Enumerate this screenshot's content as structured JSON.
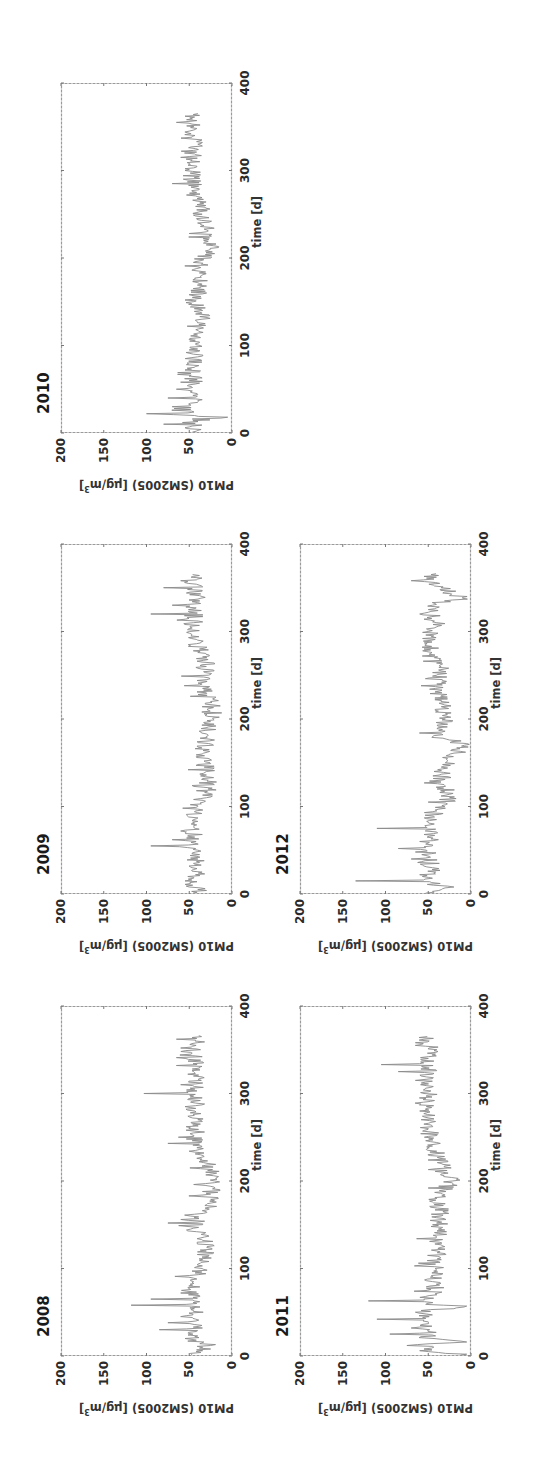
{
  "figure": {
    "ylabel_text": "PM10 (SM2005) [μg/m",
    "ylabel_sup": "3",
    "ylabel_close": "]",
    "xlabel": "time [d]",
    "x_ticks": [
      "0",
      "100",
      "200",
      "300",
      "400"
    ],
    "y_ticks": [
      "0",
      "50",
      "100",
      "150",
      "200"
    ],
    "line_color": "#8a8a8a",
    "axis_color": "#9a9a9a"
  },
  "chart_data": [
    {
      "type": "line",
      "title": "2008",
      "xlabel": "time [d]",
      "ylabel": "PM10 (SM2005) [μg/m³]",
      "xlim": [
        0,
        400
      ],
      "ylim": [
        0,
        200
      ],
      "x_ticks": [
        0,
        100,
        200,
        300,
        400
      ],
      "y_ticks": [
        0,
        50,
        100,
        150,
        200
      ],
      "grid": false,
      "n_days": 366,
      "baseline": 28,
      "key_points": [
        [
          5,
          42
        ],
        [
          12,
          25
        ],
        [
          20,
          55
        ],
        [
          30,
          85
        ],
        [
          38,
          75
        ],
        [
          45,
          60
        ],
        [
          52,
          45
        ],
        [
          58,
          118
        ],
        [
          65,
          95
        ],
        [
          72,
          60
        ],
        [
          85,
          45
        ],
        [
          100,
          35
        ],
        [
          120,
          30
        ],
        [
          140,
          32
        ],
        [
          152,
          75
        ],
        [
          165,
          30
        ],
        [
          185,
          25
        ],
        [
          200,
          20
        ],
        [
          220,
          28
        ],
        [
          243,
          75
        ],
        [
          255,
          45
        ],
        [
          270,
          40
        ],
        [
          285,
          55
        ],
        [
          300,
          103
        ],
        [
          310,
          60
        ],
        [
          320,
          45
        ],
        [
          332,
          65
        ],
        [
          345,
          48
        ],
        [
          355,
          42
        ],
        [
          362,
          65
        ]
      ]
    },
    {
      "type": "line",
      "title": "2009",
      "xlabel": "time [d]",
      "ylabel": "PM10 (SM2005) [μg/m³]",
      "xlim": [
        0,
        400
      ],
      "ylim": [
        0,
        200
      ],
      "x_ticks": [
        0,
        100,
        200,
        300,
        400
      ],
      "y_ticks": [
        0,
        50,
        100,
        150,
        200
      ],
      "grid": false,
      "n_days": 365,
      "baseline": 30,
      "key_points": [
        [
          5,
          40
        ],
        [
          15,
          55
        ],
        [
          25,
          35
        ],
        [
          35,
          45
        ],
        [
          45,
          38
        ],
        [
          55,
          95
        ],
        [
          62,
          70
        ],
        [
          72,
          60
        ],
        [
          85,
          45
        ],
        [
          100,
          40
        ],
        [
          120,
          28
        ],
        [
          140,
          30
        ],
        [
          160,
          35
        ],
        [
          180,
          30
        ],
        [
          200,
          22
        ],
        [
          220,
          25
        ],
        [
          240,
          35
        ],
        [
          260,
          30
        ],
        [
          280,
          38
        ],
        [
          300,
          50
        ],
        [
          310,
          45
        ],
        [
          320,
          95
        ],
        [
          330,
          70
        ],
        [
          340,
          35
        ],
        [
          350,
          80
        ],
        [
          358,
          60
        ],
        [
          363,
          45
        ]
      ]
    },
    {
      "type": "line",
      "title": "2010",
      "xlabel": "time [d]",
      "ylabel": "PM10 (SM2005) [μg/m³]",
      "xlim": [
        0,
        400
      ],
      "ylim": [
        0,
        200
      ],
      "x_ticks": [
        0,
        100,
        200,
        300,
        400
      ],
      "y_ticks": [
        0,
        50,
        100,
        150,
        200
      ],
      "grid": false,
      "n_days": 365,
      "baseline": 30,
      "key_points": [
        [
          3,
          40
        ],
        [
          10,
          80
        ],
        [
          18,
          5
        ],
        [
          22,
          100
        ],
        [
          30,
          70
        ],
        [
          40,
          75
        ],
        [
          50,
          65
        ],
        [
          60,
          50
        ],
        [
          72,
          55
        ],
        [
          90,
          45
        ],
        [
          110,
          40
        ],
        [
          130,
          35
        ],
        [
          150,
          45
        ],
        [
          170,
          35
        ],
        [
          190,
          40
        ],
        [
          210,
          25
        ],
        [
          230,
          30
        ],
        [
          250,
          35
        ],
        [
          270,
          40
        ],
        [
          285,
          70
        ],
        [
          300,
          55
        ],
        [
          315,
          60
        ],
        [
          330,
          40
        ],
        [
          345,
          50
        ],
        [
          355,
          65
        ],
        [
          362,
          55
        ]
      ]
    },
    {
      "type": "line",
      "title": "2011",
      "xlabel": "time [d]",
      "ylabel": "PM10 (SM2005) [μg/m³]",
      "xlim": [
        0,
        400
      ],
      "ylim": [
        0,
        200
      ],
      "x_ticks": [
        0,
        100,
        200,
        300,
        400
      ],
      "y_ticks": [
        0,
        50,
        100,
        150,
        200
      ],
      "grid": false,
      "n_days": 365,
      "baseline": 35,
      "key_points": [
        [
          2,
          5
        ],
        [
          6,
          60
        ],
        [
          12,
          75
        ],
        [
          16,
          5
        ],
        [
          25,
          95
        ],
        [
          32,
          70
        ],
        [
          42,
          110
        ],
        [
          50,
          65
        ],
        [
          57,
          5
        ],
        [
          63,
          120
        ],
        [
          70,
          40
        ],
        [
          85,
          45
        ],
        [
          100,
          42
        ],
        [
          120,
          40
        ],
        [
          140,
          38
        ],
        [
          160,
          35
        ],
        [
          180,
          40
        ],
        [
          200,
          22
        ],
        [
          220,
          35
        ],
        [
          240,
          45
        ],
        [
          260,
          50
        ],
        [
          280,
          60
        ],
        [
          300,
          55
        ],
        [
          315,
          65
        ],
        [
          325,
          85
        ],
        [
          333,
          105
        ],
        [
          342,
          50
        ],
        [
          350,
          40
        ],
        [
          358,
          65
        ],
        [
          362,
          55
        ]
      ]
    },
    {
      "type": "line",
      "title": "2012",
      "xlabel": "time [d]",
      "ylabel": "PM10 (SM2005) [μg/m³]",
      "xlim": [
        0,
        400
      ],
      "ylim": [
        0,
        200
      ],
      "x_ticks": [
        0,
        100,
        200,
        300,
        400
      ],
      "y_ticks": [
        0,
        50,
        100,
        150,
        200
      ],
      "grid": false,
      "n_days": 366,
      "baseline": 32,
      "key_points": [
        [
          3,
          45
        ],
        [
          8,
          20
        ],
        [
          15,
          135
        ],
        [
          22,
          60
        ],
        [
          30,
          45
        ],
        [
          40,
          70
        ],
        [
          48,
          65
        ],
        [
          52,
          85
        ],
        [
          60,
          60
        ],
        [
          68,
          55
        ],
        [
          75,
          110
        ],
        [
          82,
          50
        ],
        [
          95,
          40
        ],
        [
          110,
          25
        ],
        [
          130,
          35
        ],
        [
          150,
          30
        ],
        [
          172,
          5
        ],
        [
          180,
          45
        ],
        [
          200,
          30
        ],
        [
          220,
          35
        ],
        [
          240,
          40
        ],
        [
          260,
          35
        ],
        [
          280,
          55
        ],
        [
          300,
          50
        ],
        [
          310,
          40
        ],
        [
          320,
          60
        ],
        [
          330,
          45
        ],
        [
          338,
          10
        ],
        [
          350,
          35
        ],
        [
          358,
          70
        ],
        [
          363,
          55
        ]
      ]
    }
  ],
  "layout": {
    "panels": [
      {
        "left": 115,
        "top": 61
      },
      {
        "left": 577,
        "top": 61
      },
      {
        "left": 1038,
        "top": 61
      },
      {
        "left": 115,
        "top": 300
      },
      {
        "left": 577,
        "top": 300
      }
    ],
    "plot_width": 350,
    "plot_height": 171
  }
}
